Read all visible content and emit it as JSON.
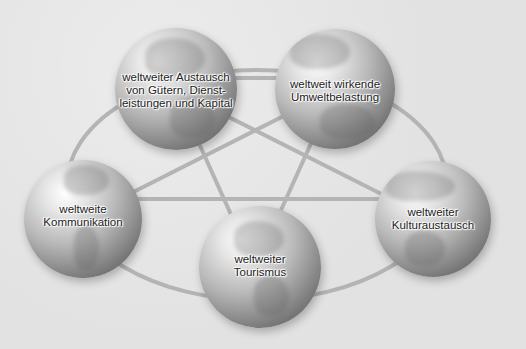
{
  "diagram": {
    "type": "network of five globes connected by a ring and pentagram lines",
    "nodes": [
      {
        "id": "austausch",
        "lines": [
          "weltweiter Austausch",
          "von Gütern, Dienst-",
          "leistungen und Kapital"
        ]
      },
      {
        "id": "umwelt",
        "lines": [
          "weltweit wirkende",
          "Umweltbelastung"
        ]
      },
      {
        "id": "kommunikation",
        "lines": [
          "weltweite",
          "Kommunikation"
        ]
      },
      {
        "id": "kultur",
        "lines": [
          "weltweiter",
          "Kulturaustausch"
        ]
      },
      {
        "id": "tourismus",
        "lines": [
          "weltweiter",
          "Tourismus"
        ]
      }
    ],
    "edges": [
      [
        "austausch",
        "umwelt"
      ],
      [
        "austausch",
        "kultur"
      ],
      [
        "austausch",
        "tourismus"
      ],
      [
        "umwelt",
        "kommunikation"
      ],
      [
        "umwelt",
        "tourismus"
      ],
      [
        "kommunikation",
        "kultur"
      ],
      [
        "kommunikation",
        "tourismus"
      ],
      [
        "kultur",
        "tourismus"
      ]
    ],
    "colors": {
      "background": "#e2e2e2",
      "connector": "#b4b4b4",
      "text": "#222222"
    }
  }
}
